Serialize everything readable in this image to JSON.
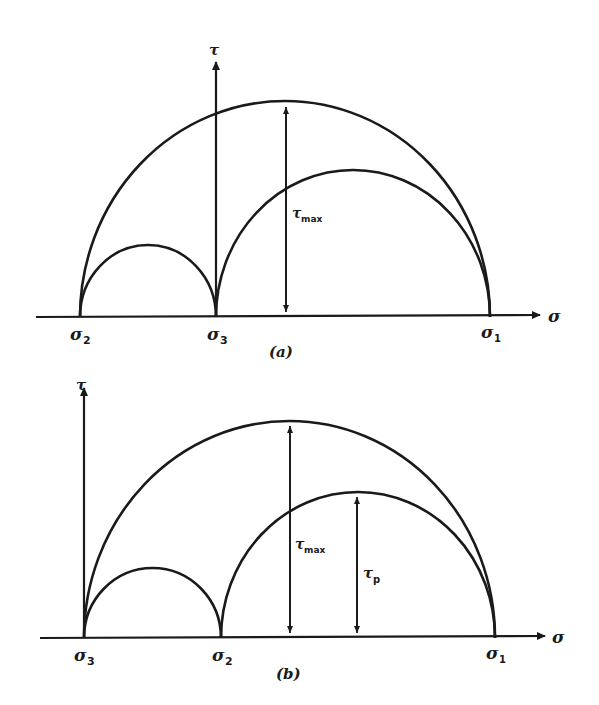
{
  "figure": {
    "panel_a": {
      "caption": "(a)",
      "y_axis_label": "τ",
      "x_axis_label": "σ",
      "points": {
        "left": {
          "sym": "σ",
          "sub": "2"
        },
        "mid": {
          "sym": "σ",
          "sub": "3"
        },
        "right": {
          "sym": "σ",
          "sub": "1"
        }
      },
      "dimension_label": {
        "sym": "τ",
        "sub": "max"
      }
    },
    "panel_b": {
      "caption": "(b)",
      "y_axis_label": "τ",
      "x_axis_label": "σ",
      "points": {
        "left": {
          "sym": "σ",
          "sub": "3"
        },
        "mid": {
          "sym": "σ",
          "sub": "2"
        },
        "right": {
          "sym": "σ",
          "sub": "1"
        }
      },
      "dimension_label": {
        "sym": "τ",
        "sub": "max"
      },
      "dimension_label_2": {
        "sym": "τ",
        "sub": "p"
      }
    }
  }
}
